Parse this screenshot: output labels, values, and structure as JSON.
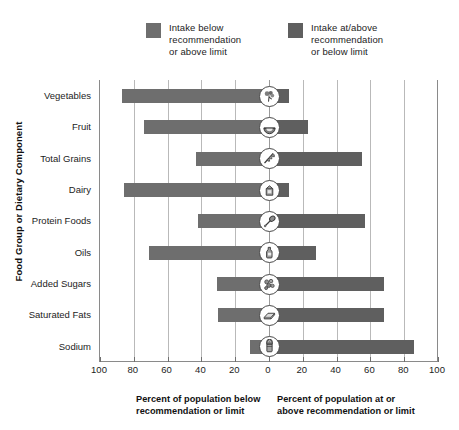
{
  "legend": {
    "items": [
      {
        "label": "Intake below\nrecommendation\nor above limit",
        "color": "#6e6e6e",
        "name": "legend-below"
      },
      {
        "label": "Intake at/above\nrecommendation\nor below limit",
        "color": "#5f5f5f",
        "name": "legend-above"
      }
    ]
  },
  "axes": {
    "y_title": "Food Group or Dietary Component",
    "x_ticks": [
      "100",
      "80",
      "60",
      "40",
      "20",
      "0",
      "20",
      "40",
      "60",
      "80",
      "100"
    ],
    "caption_left": "Percent of population below\nrecommendation or limit",
    "caption_right": "Percent of population at or\nabove recommendation or limit"
  },
  "chart_data": {
    "type": "bar",
    "orientation": "horizontal-diverging",
    "title": "",
    "xlabel": "Percent of population",
    "ylabel": "Food Group or Dietary Component",
    "xlim": [
      -100,
      100
    ],
    "xticks": [
      -100,
      -80,
      -60,
      -40,
      -20,
      0,
      20,
      40,
      60,
      80,
      100
    ],
    "xtick_labels": [
      "100",
      "80",
      "60",
      "40",
      "20",
      "0",
      "20",
      "40",
      "60",
      "80",
      "100"
    ],
    "grid": true,
    "legend_position": "top",
    "categories": [
      "Vegetables",
      "Fruit",
      "Total Grains",
      "Dairy",
      "Protein Foods",
      "Oils",
      "Added Sugars",
      "Saturated Fats",
      "Sodium"
    ],
    "series": [
      {
        "name": "Intake below recommendation or above limit",
        "color": "#6e6e6e",
        "values": [
          87,
          74,
          43,
          86,
          42,
          71,
          31,
          30,
          11
        ]
      },
      {
        "name": "Intake at/above recommendation or below limit",
        "color": "#5f5f5f",
        "values": [
          12,
          23,
          55,
          12,
          57,
          28,
          68,
          68,
          86
        ]
      }
    ],
    "rows": [
      {
        "category": "Vegetables",
        "below": 87,
        "above": 12,
        "icon": "broccoli-icon"
      },
      {
        "category": "Fruit",
        "below": 74,
        "above": 23,
        "icon": "fruit-slice-icon"
      },
      {
        "category": "Total Grains",
        "below": 43,
        "above": 55,
        "icon": "grain-icon"
      },
      {
        "category": "Dairy",
        "below": 86,
        "above": 12,
        "icon": "milk-carton-icon"
      },
      {
        "category": "Protein Foods",
        "below": 42,
        "above": 57,
        "icon": "protein-icon"
      },
      {
        "category": "Oils",
        "below": 71,
        "above": 28,
        "icon": "oil-bottle-icon"
      },
      {
        "category": "Added Sugars",
        "below": 31,
        "above": 68,
        "icon": "sugar-cubes-icon"
      },
      {
        "category": "Saturated Fats",
        "below": 30,
        "above": 68,
        "icon": "butter-icon"
      },
      {
        "category": "Sodium",
        "below": 11,
        "above": 86,
        "icon": "salt-shaker-icon"
      }
    ]
  }
}
